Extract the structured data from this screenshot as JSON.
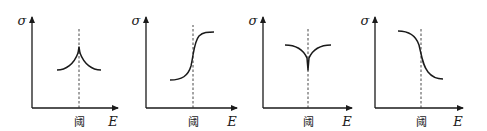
{
  "figure": {
    "panels": [
      {
        "id": "panel-1",
        "curve_shape": "peak-cusp-up",
        "y_label": "σ",
        "x_label": "E",
        "threshold_label": "阈",
        "origin": [
          32,
          108
        ],
        "y_top": 17,
        "x_right": 118,
        "threshold_x": 79,
        "dashed_top": 27,
        "curve_path": "M57,70 C66,70 74,64 78,53 L79,47 L80,53 C84,64 92,70 101,70"
      },
      {
        "id": "panel-2",
        "curve_shape": "rising-sigmoid",
        "y_label": "σ",
        "x_label": "E",
        "threshold_label": "阈",
        "origin": [
          146,
          108
        ],
        "y_top": 17,
        "x_right": 237,
        "threshold_x": 193,
        "dashed_top": 25,
        "curve_path": "M170,80 C182,80 188,76 191,66 C194,52 194,42 199,36 C203,32 208,32 214,32"
      },
      {
        "id": "panel-3",
        "curve_shape": "dip-cusp-down",
        "y_label": "σ",
        "x_label": "E",
        "threshold_label": "阈",
        "origin": [
          263,
          108
        ],
        "y_top": 17,
        "x_right": 352,
        "threshold_x": 308,
        "dashed_top": 27,
        "curve_path": "M285,45 C295,45 303,49 307,58 L308,70 L309,58 C313,49 321,45 331,45"
      },
      {
        "id": "panel-4",
        "curve_shape": "falling-sigmoid",
        "y_label": "σ",
        "x_label": "E",
        "threshold_label": "阈",
        "origin": [
          375,
          108
        ],
        "y_top": 17,
        "x_right": 463,
        "threshold_x": 421,
        "dashed_top": 27,
        "curve_path": "M398,31 C410,31 416,36 419,45 C422,58 423,66 428,72 C432,77 437,79 443,79"
      }
    ],
    "colors": {
      "line": "#1a1a1a",
      "dashed": "#333333",
      "background": "#ffffff"
    }
  }
}
